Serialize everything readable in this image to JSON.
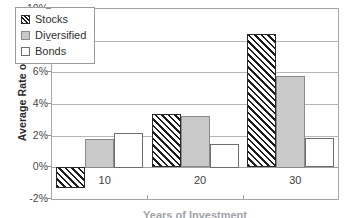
{
  "chart_data": {
    "type": "bar",
    "title": "",
    "subtitle": "",
    "xlabel": "Years of Investment",
    "ylabel": "Average Rate of Return",
    "categories": [
      "10",
      "20",
      "30"
    ],
    "series": [
      {
        "name": "Stocks",
        "values": [
          -1.3,
          3.35,
          8.4
        ]
      },
      {
        "name": "Diversified",
        "values": [
          1.8,
          3.25,
          5.8
        ]
      },
      {
        "name": "Bonds",
        "values": [
          2.2,
          1.5,
          1.85
        ]
      }
    ],
    "ylim": [
      -2,
      10
    ],
    "ytick_step": 2,
    "ytick_labels": [
      "10%",
      "8%",
      "6%",
      "4%",
      "2%",
      "0%",
      "-2%"
    ],
    "ytick_values": [
      10,
      8,
      6,
      4,
      2,
      0,
      -2
    ],
    "grid": true,
    "legend_position": "top-left-inside",
    "value_suffix": "%"
  },
  "legend": {
    "items": [
      {
        "label": "Stocks",
        "swatch": "hatch-diagonal-swatch",
        "color": "#1c1c1c"
      },
      {
        "label": "Diversified",
        "swatch": "gray-fill-swatch",
        "color": "#c9c9c9"
      },
      {
        "label": "Bonds",
        "swatch": "white-fill-swatch",
        "color": "#ffffff"
      }
    ]
  },
  "axes": {
    "y_title": "Average Rate of Return",
    "x_title": "Years of Investment"
  },
  "colors": {
    "plot_border": "#a6a6a6",
    "gridline": "#b5b5b5",
    "stocks": "#1c1c1c",
    "diversified": "#c9c9c9",
    "bonds": "#ffffff",
    "text": "#333333",
    "background": "#ffffff"
  }
}
